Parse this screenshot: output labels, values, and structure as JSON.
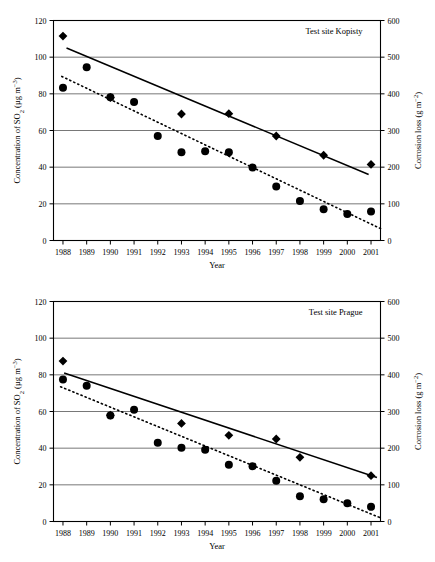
{
  "figure": {
    "panel_count": 2,
    "background": "#ffffff",
    "line_color": "#000000",
    "grid_color": "#555555"
  },
  "chart_data": [
    {
      "type": "scatter",
      "title": "Test site  Kopisty",
      "xlabel": "Year",
      "ylabel": "Concentration of SO2 (µg m-3)",
      "ylabel_rich": "Concentration of SO₂ (µg m⁻³)",
      "y2label": "Corrosion loss (g m-2)",
      "y2label_rich": "Corrosion loss (g m⁻²)",
      "grid": true,
      "legend": "none",
      "x": [
        1988,
        1989,
        1990,
        1991,
        1992,
        1993,
        1994,
        1995,
        1996,
        1997,
        1998,
        1999,
        2000,
        2001
      ],
      "xticklabels": [
        "1988",
        "1989",
        "1990",
        "1991",
        "1992",
        "1993",
        "1994",
        "1995",
        "1996",
        "1997",
        "1998",
        "1999",
        "2000",
        "2001"
      ],
      "xlim": [
        1987.6,
        2001.4
      ],
      "ylim": [
        0,
        120
      ],
      "yticks": [
        0,
        20,
        40,
        60,
        80,
        100,
        120
      ],
      "yticklabels": [
        "0",
        "20",
        "40",
        "60",
        "80",
        "100",
        "120"
      ],
      "y2lim": [
        0,
        600
      ],
      "y2ticks": [
        0,
        100,
        200,
        300,
        400,
        500,
        600
      ],
      "y2ticklabels": [
        "0",
        "100",
        "200",
        "300",
        "400",
        "500",
        "600"
      ],
      "series": [
        {
          "name": "Corrosion loss",
          "marker": "diamond",
          "axis": "right",
          "x": [
            1988,
            1990,
            1993,
            1995,
            1997,
            1999,
            2001
          ],
          "values_left_equiv": [
            111.5,
            78.0,
            69.0,
            69.2,
            57.0,
            46.5,
            41.5
          ],
          "values": [
            558,
            390,
            345,
            346,
            285,
            233,
            208
          ]
        },
        {
          "name": "SO2 concentration",
          "marker": "circle",
          "axis": "left",
          "x": [
            1988,
            1989,
            1990,
            1991,
            1992,
            1993,
            1994,
            1995,
            1996,
            1997,
            1998,
            1999,
            2000,
            2001
          ],
          "values": [
            83.3,
            94.5,
            78.2,
            75.5,
            57.0,
            48.2,
            48.7,
            48.2,
            39.8,
            29.5,
            21.5,
            17.0,
            14.5,
            15.8
          ]
        }
      ],
      "trendlines": [
        {
          "name": "corrosion-trend",
          "style": "solid",
          "x": [
            1988.15,
            2000.9
          ],
          "y": [
            105.0,
            36.0
          ]
        },
        {
          "name": "so2-trend",
          "style": "dotted",
          "x": [
            1987.95,
            2001.4
          ],
          "y": [
            89.5,
            6.5
          ]
        }
      ]
    },
    {
      "type": "scatter",
      "title": "Test site  Prague",
      "xlabel": "Year",
      "ylabel": "Concentration of SO2 (µg m-3)",
      "ylabel_rich": "Concentration of SO₂ (µg m⁻³)",
      "y2label": "Corrosion loss (g m-2)",
      "y2label_rich": "Corrosion loss (g m⁻²)",
      "grid": true,
      "legend": "none",
      "x": [
        1988,
        1989,
        1990,
        1991,
        1992,
        1993,
        1994,
        1995,
        1996,
        1997,
        1998,
        1999,
        2000,
        2001
      ],
      "xticklabels": [
        "1988",
        "1989",
        "1990",
        "1991",
        "1992",
        "1993",
        "1994",
        "1995",
        "1996",
        "1997",
        "1998",
        "1999",
        "2000",
        "2001"
      ],
      "xlim": [
        1987.6,
        2001.4
      ],
      "ylim": [
        0,
        120
      ],
      "yticks": [
        0,
        20,
        40,
        60,
        80,
        100,
        120
      ],
      "yticklabels": [
        "0",
        "20",
        "40",
        "60",
        "80",
        "100",
        "120"
      ],
      "y2lim": [
        0,
        600
      ],
      "y2ticks": [
        0,
        100,
        200,
        300,
        400,
        500,
        600
      ],
      "y2ticklabels": [
        "0",
        "100",
        "200",
        "300",
        "400",
        "500",
        "600"
      ],
      "series": [
        {
          "name": "Corrosion loss",
          "marker": "diamond",
          "axis": "right",
          "x": [
            1988,
            1990,
            1993,
            1995,
            1997,
            1998,
            2001
          ],
          "values_left_equiv": [
            87.5,
            58.0,
            53.5,
            47.0,
            45.0,
            35.0,
            25.0
          ],
          "values": [
            438,
            290,
            268,
            235,
            225,
            175,
            125
          ]
        },
        {
          "name": "SO2 concentration",
          "marker": "circle",
          "axis": "left",
          "x": [
            1988,
            1989,
            1990,
            1991,
            1992,
            1993,
            1994,
            1995,
            1996,
            1997,
            1998,
            1999,
            2000,
            2001
          ],
          "values": [
            77.5,
            74.0,
            57.8,
            61.0,
            43.0,
            40.2,
            39.2,
            31.0,
            30.2,
            22.2,
            13.8,
            12.2,
            10.0,
            8.0
          ]
        }
      ],
      "trendlines": [
        {
          "name": "corrosion-trend",
          "style": "solid",
          "x": [
            1988.05,
            2001.25
          ],
          "y": [
            81.0,
            24.0
          ]
        },
        {
          "name": "so2-trend",
          "style": "dotted",
          "x": [
            1987.9,
            2001.4
          ],
          "y": [
            73.5,
            2.0
          ]
        }
      ]
    }
  ]
}
